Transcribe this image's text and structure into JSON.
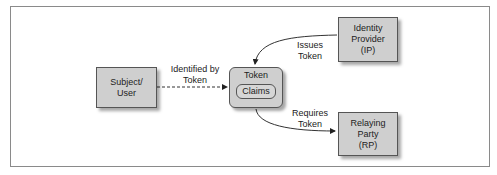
{
  "diagram": {
    "nodes": {
      "subject": {
        "label": "Subject/\nUser"
      },
      "token": {
        "label": "Token",
        "inner": "Claims"
      },
      "identity_provider": {
        "label": "Identity\nProvider\n(IP)"
      },
      "relying_party": {
        "label": "Relaying Party\n(RP)"
      }
    },
    "edges": {
      "subject_to_token": {
        "label": "Identified by\nToken",
        "style": "dashed"
      },
      "ip_to_token": {
        "label": "Issues\nToken",
        "style": "solid"
      },
      "token_to_rp": {
        "label": "Requires\nToken",
        "style": "solid"
      }
    },
    "colors": {
      "box_fill": "#cfcfcf",
      "box_border": "#555555",
      "frame_border": "#8a8a8a"
    }
  }
}
